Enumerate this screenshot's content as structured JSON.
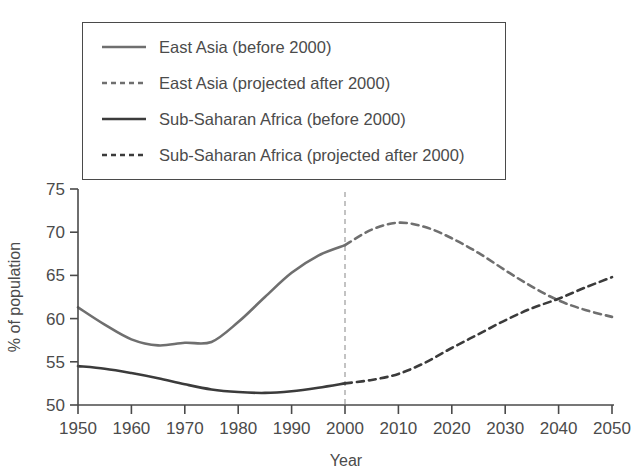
{
  "chart_data": {
    "type": "line",
    "title": "",
    "xlabel": "Year",
    "ylabel": "% of population",
    "xlim": [
      1950,
      2050
    ],
    "ylim": [
      50,
      75
    ],
    "xticks": [
      1950,
      1960,
      1970,
      1980,
      1990,
      2000,
      2010,
      2020,
      2030,
      2040,
      2050
    ],
    "yticks": [
      50,
      55,
      60,
      65,
      70,
      75
    ],
    "grid": false,
    "legend_position": "top-left",
    "projection_divider_year": 2000,
    "series": [
      {
        "name": "East Asia (before 2000)",
        "style": "solid",
        "color": "#6f6f6f",
        "x": [
          1950,
          1955,
          1960,
          1965,
          1970,
          1975,
          1980,
          1985,
          1990,
          1995,
          2000
        ],
        "values": [
          61.3,
          59.3,
          57.6,
          56.9,
          57.2,
          57.3,
          59.6,
          62.5,
          65.3,
          67.3,
          68.5
        ]
      },
      {
        "name": "East Asia (projected after 2000)",
        "style": "dashed",
        "color": "#6f6f6f",
        "x": [
          2000,
          2005,
          2010,
          2015,
          2020,
          2025,
          2030,
          2035,
          2040,
          2045,
          2050
        ],
        "values": [
          68.5,
          70.3,
          71.1,
          70.6,
          69.3,
          67.6,
          65.6,
          63.7,
          62.1,
          61.0,
          60.2
        ]
      },
      {
        "name": "Sub-Saharan Africa (before 2000)",
        "style": "solid",
        "color": "#3b3b3b",
        "x": [
          1950,
          1955,
          1960,
          1965,
          1970,
          1975,
          1980,
          1985,
          1990,
          1995,
          2000
        ],
        "values": [
          54.5,
          54.2,
          53.7,
          53.1,
          52.4,
          51.8,
          51.5,
          51.4,
          51.6,
          52.0,
          52.5
        ]
      },
      {
        "name": "Sub-Saharan Africa (projected after 2000)",
        "style": "dashed",
        "color": "#3b3b3b",
        "x": [
          2000,
          2005,
          2010,
          2015,
          2020,
          2025,
          2030,
          2035,
          2040,
          2045,
          2050
        ],
        "values": [
          52.5,
          52.9,
          53.6,
          54.9,
          56.6,
          58.2,
          59.8,
          61.2,
          62.3,
          63.6,
          64.8
        ]
      }
    ],
    "annotations": [
      {
        "type": "vline",
        "x": 2000,
        "style": "dashed",
        "color": "#b5b5b5"
      }
    ]
  },
  "legend": {
    "items": [
      {
        "label": "East Asia (before 2000)",
        "style": "solid",
        "color": "#6f6f6f"
      },
      {
        "label": "East Asia (projected after 2000)",
        "style": "dashed",
        "color": "#6f6f6f"
      },
      {
        "label": "Sub-Saharan Africa (before 2000)",
        "style": "solid",
        "color": "#3b3b3b"
      },
      {
        "label": "Sub-Saharan Africa (projected after 2000)",
        "style": "dashed",
        "color": "#3b3b3b"
      }
    ]
  },
  "axes": {
    "x_title": "Year",
    "y_title": "% of population",
    "x_tick_labels": [
      "1950",
      "1960",
      "1970",
      "1980",
      "1990",
      "2000",
      "2010",
      "2020",
      "2030",
      "2040",
      "2050"
    ],
    "y_tick_labels": [
      "75",
      "70",
      "65",
      "60",
      "55",
      "50"
    ]
  }
}
